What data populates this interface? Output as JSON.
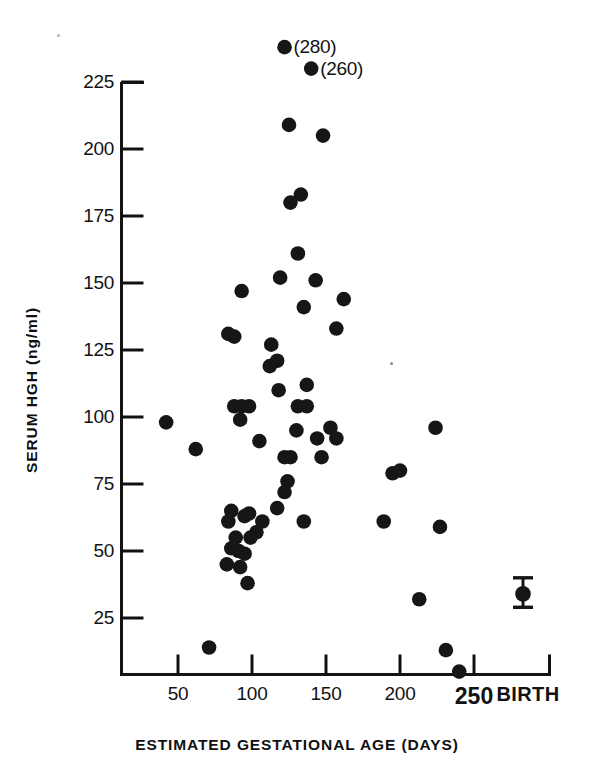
{
  "figure": {
    "background_color": "#ffffff",
    "ink_color": "#111111",
    "marker_color": "#161616"
  },
  "chart_data": {
    "type": "scatter",
    "title": "",
    "xlabel": "ESTIMATED GESTATIONAL AGE (DAYS)",
    "ylabel": "SERUM HGH (ng/ml)",
    "xlim": [
      20,
      300
    ],
    "ylim": [
      0,
      240
    ],
    "xticks": [
      50,
      100,
      150,
      200,
      250
    ],
    "xtick_labels": [
      "50",
      "100",
      "150",
      "200",
      "250"
    ],
    "extra_xtick_label": "BIRTH",
    "yticks": [
      25,
      50,
      75,
      100,
      125,
      150,
      175,
      200,
      225
    ],
    "ytick_labels": [
      "25",
      "50",
      "75",
      "100",
      "125",
      "150",
      "175",
      "200",
      "225"
    ],
    "grid": false,
    "legend": null,
    "annotations": [
      {
        "label": "(280)",
        "x": 122,
        "y": 238,
        "note": "off-scale value 280"
      },
      {
        "label": "(260)",
        "x": 140,
        "y": 230,
        "note": "off-scale value 260"
      }
    ],
    "error_bar": {
      "x_category": "BIRTH",
      "y": 34,
      "y_low": 29,
      "y_high": 40
    },
    "points": [
      {
        "x": 122,
        "y": 238
      },
      {
        "x": 140,
        "y": 230
      },
      {
        "x": 125,
        "y": 209
      },
      {
        "x": 148,
        "y": 205
      },
      {
        "x": 133,
        "y": 183
      },
      {
        "x": 126,
        "y": 180
      },
      {
        "x": 131,
        "y": 161
      },
      {
        "x": 119,
        "y": 152
      },
      {
        "x": 143,
        "y": 151
      },
      {
        "x": 162,
        "y": 144
      },
      {
        "x": 93,
        "y": 147
      },
      {
        "x": 135,
        "y": 141
      },
      {
        "x": 157,
        "y": 133
      },
      {
        "x": 84,
        "y": 131
      },
      {
        "x": 88,
        "y": 130
      },
      {
        "x": 113,
        "y": 127
      },
      {
        "x": 112,
        "y": 119
      },
      {
        "x": 117,
        "y": 121
      },
      {
        "x": 137,
        "y": 112
      },
      {
        "x": 118,
        "y": 110
      },
      {
        "x": 88,
        "y": 104
      },
      {
        "x": 93,
        "y": 104
      },
      {
        "x": 98,
        "y": 104
      },
      {
        "x": 131,
        "y": 104
      },
      {
        "x": 137,
        "y": 104
      },
      {
        "x": 92,
        "y": 99
      },
      {
        "x": 42,
        "y": 98
      },
      {
        "x": 153,
        "y": 96
      },
      {
        "x": 224,
        "y": 96
      },
      {
        "x": 130,
        "y": 95
      },
      {
        "x": 105,
        "y": 91
      },
      {
        "x": 144,
        "y": 92
      },
      {
        "x": 157,
        "y": 92
      },
      {
        "x": 62,
        "y": 88
      },
      {
        "x": 122,
        "y": 85
      },
      {
        "x": 126,
        "y": 85
      },
      {
        "x": 147,
        "y": 85
      },
      {
        "x": 195,
        "y": 79
      },
      {
        "x": 200,
        "y": 80
      },
      {
        "x": 124,
        "y": 76
      },
      {
        "x": 122,
        "y": 72
      },
      {
        "x": 117,
        "y": 66
      },
      {
        "x": 135,
        "y": 61
      },
      {
        "x": 189,
        "y": 61
      },
      {
        "x": 86,
        "y": 65
      },
      {
        "x": 95,
        "y": 63
      },
      {
        "x": 98,
        "y": 64
      },
      {
        "x": 84,
        "y": 61
      },
      {
        "x": 107,
        "y": 61
      },
      {
        "x": 227,
        "y": 59
      },
      {
        "x": 103,
        "y": 57
      },
      {
        "x": 89,
        "y": 55
      },
      {
        "x": 99,
        "y": 55
      },
      {
        "x": 86,
        "y": 51
      },
      {
        "x": 91,
        "y": 50
      },
      {
        "x": 95,
        "y": 49
      },
      {
        "x": 83,
        "y": 45
      },
      {
        "x": 92,
        "y": 44
      },
      {
        "x": 97,
        "y": 38
      },
      {
        "x": 213,
        "y": 32
      },
      {
        "x": 71,
        "y": 14
      },
      {
        "x": 231,
        "y": 13
      },
      {
        "x": 240,
        "y": 5
      }
    ]
  },
  "axes": {
    "y_axis_name": "serum-hgh-axis",
    "x_axis_name": "gestational-age-axis"
  }
}
